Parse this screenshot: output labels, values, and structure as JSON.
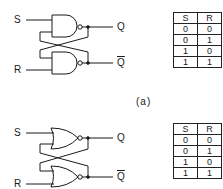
{
  "caption": "(a)",
  "circuits": [
    {
      "gate_type": "NAND",
      "inputs": {
        "s": "S",
        "r": "R"
      },
      "outputs": {
        "q": "Q",
        "qbar": "Q"
      }
    },
    {
      "gate_type": "NOR",
      "inputs": {
        "s": "S",
        "r": "R"
      },
      "outputs": {
        "q": "Q",
        "qbar": "Q"
      }
    }
  ],
  "tables": [
    {
      "headers": [
        "S",
        "R"
      ],
      "rows": [
        [
          "0",
          "0"
        ],
        [
          "0",
          "1"
        ],
        [
          "1",
          "0"
        ],
        [
          "1",
          "1"
        ]
      ]
    },
    {
      "headers": [
        "S",
        "R"
      ],
      "rows": [
        [
          "0",
          "0"
        ],
        [
          "0",
          "1"
        ],
        [
          "1",
          "0"
        ],
        [
          "1",
          "1"
        ]
      ]
    }
  ]
}
